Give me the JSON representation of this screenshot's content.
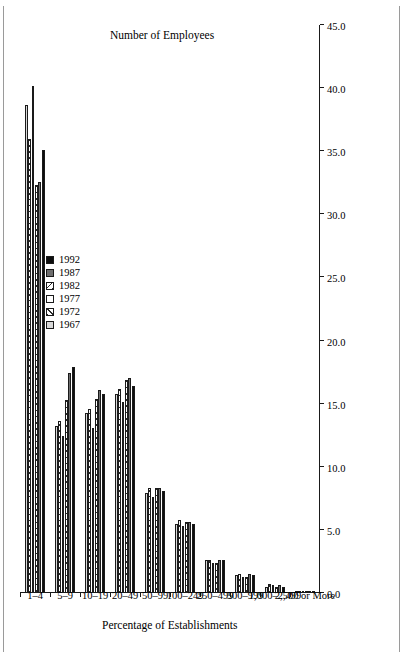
{
  "figure": {
    "value_axis_title": "Percentage of Establishments",
    "category_axis_title": "Number of Employees"
  },
  "legend": {
    "items": [
      {
        "label": "1967",
        "swatch": "light-gray-swatch"
      },
      {
        "label": "1972",
        "swatch": "dark-hatch-swatch"
      },
      {
        "label": "1977",
        "swatch": "white-swatch"
      },
      {
        "label": "1982",
        "swatch": "light-hatch-swatch"
      },
      {
        "label": "1987",
        "swatch": "gray-swatch"
      },
      {
        "label": "1992",
        "swatch": "black-swatch"
      }
    ]
  },
  "chart_data": {
    "type": "bar",
    "orientation": "horizontal",
    "title": "",
    "xlabel": "Number of Employees",
    "ylabel": "Percentage of Establishments",
    "ylim": [
      0.0,
      45.0
    ],
    "ytick_step": 5.0,
    "ytick_labels": [
      "0.0",
      "5.0",
      "10.0",
      "15.0",
      "20.0",
      "25.0",
      "30.0",
      "35.0",
      "40.0",
      "45.0"
    ],
    "grid": false,
    "legend_position": "upper-center",
    "categories": [
      "1–4",
      "5–9",
      "10–19",
      "20–49",
      "50–99",
      "100–249",
      "250–499",
      "500–999",
      "1,000–2,499",
      "2,500 or More"
    ],
    "series": [
      {
        "name": "1967",
        "fill": "#d8d8d8",
        "values": [
          38.7,
          13.2,
          14.3,
          15.8,
          7.9,
          5.5,
          2.6,
          1.4,
          0.5,
          0.1
        ]
      },
      {
        "name": "1972",
        "fill": "hatch-dark",
        "values": [
          36.0,
          13.6,
          14.6,
          16.2,
          8.3,
          5.8,
          2.6,
          1.5,
          0.7,
          0.1
        ]
      },
      {
        "name": "1977",
        "fill": "#ffffff",
        "values": [
          40.2,
          12.4,
          13.1,
          15.1,
          7.6,
          5.3,
          2.4,
          1.3,
          0.6,
          0.1
        ]
      },
      {
        "name": "1982",
        "fill": "hatch-light",
        "values": [
          32.3,
          15.3,
          15.4,
          16.9,
          8.3,
          5.6,
          2.4,
          1.3,
          0.5,
          0.1
        ]
      },
      {
        "name": "1987",
        "fill": "#6e6e6e",
        "values": [
          32.6,
          17.4,
          16.1,
          17.0,
          8.3,
          5.6,
          2.6,
          1.5,
          0.6,
          0.1
        ]
      },
      {
        "name": "1992",
        "fill": "#0d0d0d",
        "values": [
          35.1,
          17.9,
          15.8,
          16.4,
          8.1,
          5.5,
          2.6,
          1.4,
          0.5,
          0.1
        ]
      }
    ]
  }
}
